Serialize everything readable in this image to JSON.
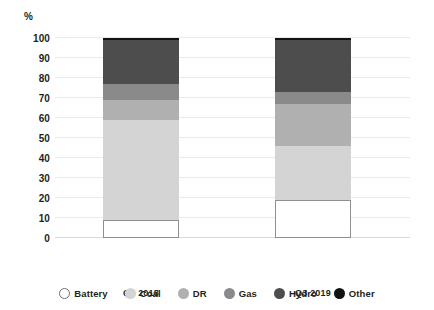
{
  "chart_data": {
    "type": "bar",
    "title": "",
    "subtitle": "",
    "stacked": true,
    "xlabel": "",
    "ylabel": "%",
    "ylim": [
      0,
      100
    ],
    "yticks": [
      0,
      10,
      20,
      30,
      40,
      50,
      60,
      70,
      80,
      90,
      100
    ],
    "ytick_labels": [
      "0",
      "10",
      "20",
      "30",
      "40",
      "50",
      "60",
      "70",
      "80",
      "90",
      "100"
    ],
    "grid": true,
    "grid_axis": "y",
    "legend_position": "bottom",
    "categories": [
      "Q3 2018",
      "Q3 2019"
    ],
    "series": [
      {
        "name": "Battery",
        "color": "#ffffff",
        "edge_color": "#8e8e93",
        "values": [
          9,
          19
        ]
      },
      {
        "name": "Coal",
        "color": "#d4d4d4",
        "edge_color": "#d4d4d4",
        "values": [
          50,
          27
        ]
      },
      {
        "name": "DR",
        "color": "#b0b0b0",
        "edge_color": "#b0b0b0",
        "values": [
          10,
          21
        ]
      },
      {
        "name": "Gas",
        "color": "#8a8a8a",
        "edge_color": "#8a8a8a",
        "values": [
          8,
          6
        ]
      },
      {
        "name": "Hydro",
        "color": "#4d4d4d",
        "edge_color": "#4d4d4d",
        "values": [
          22,
          26
        ]
      },
      {
        "name": "Other",
        "color": "#121212",
        "edge_color": "#121212",
        "values": [
          1,
          1
        ]
      }
    ],
    "cumulative_tops": {
      "Q3 2018": {
        "Battery": 9,
        "Coal": 59,
        "DR": 69,
        "Gas": 77,
        "Hydro": 99,
        "Other": 100
      },
      "Q3 2019": {
        "Battery": 19,
        "Coal": 46,
        "DR": 67,
        "Gas": 73,
        "Hydro": 99,
        "Other": 100
      }
    }
  },
  "legend": {
    "items": [
      {
        "label": "Battery"
      },
      {
        "label": "Coal"
      },
      {
        "label": "DR"
      },
      {
        "label": "Gas"
      },
      {
        "label": "Hydro"
      },
      {
        "label": "Other"
      }
    ]
  },
  "axis": {
    "unit_label": "%"
  }
}
